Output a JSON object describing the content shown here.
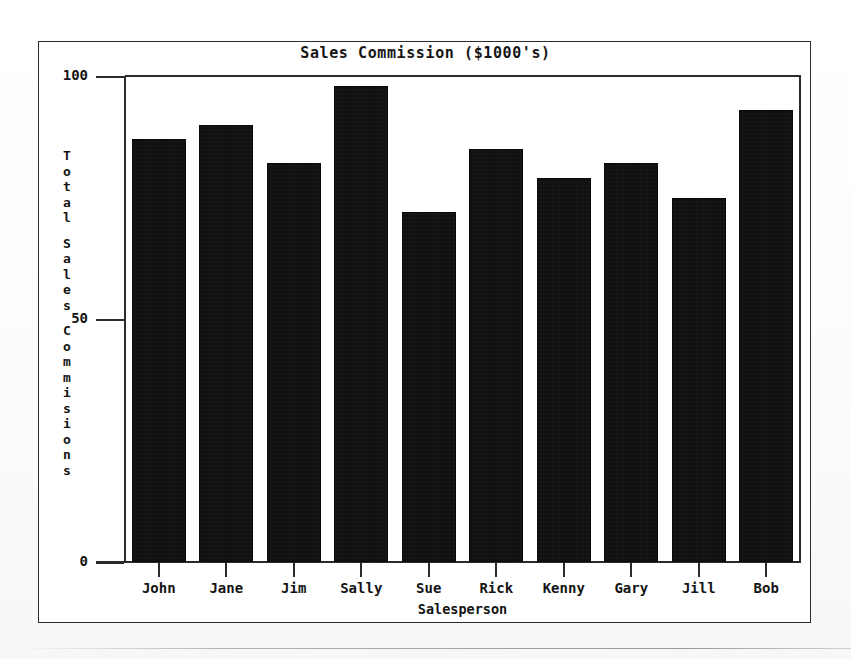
{
  "chart_data": {
    "type": "bar",
    "title": "Sales Commission ($1000's)",
    "xlabel": "Salesperson",
    "ylabel": "Total Sales Commisions",
    "ylabel_chars": [
      "T",
      "o",
      "t",
      "a",
      "l",
      "",
      "S",
      "a",
      "l",
      "e",
      "s",
      "",
      "C",
      "o",
      "m",
      "m",
      "i",
      "s",
      "i",
      "o",
      "n",
      "s"
    ],
    "categories": [
      "John",
      "Jane",
      "Jim",
      "Sally",
      "Sue",
      "Rick",
      "Kenny",
      "Gary",
      "Jill",
      "Bob"
    ],
    "values": [
      87,
      90,
      82,
      98,
      72,
      85,
      79,
      82,
      75,
      93
    ],
    "ylim": [
      0,
      100
    ],
    "yticks": [
      0,
      50,
      100
    ],
    "ytick_labels": [
      "0",
      "50",
      "100"
    ],
    "grid": false,
    "legend": "none",
    "bar_color": "#0b0b0b",
    "axis_color": "#2b2b2b",
    "background_color": "#ffffff"
  }
}
